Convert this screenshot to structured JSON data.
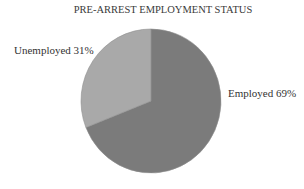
{
  "chart_data": {
    "type": "pie",
    "title": "PRE-ARREST EMPLOYMENT STATUS",
    "categories": [
      "Employed",
      "Unemployed"
    ],
    "values": [
      69,
      31
    ],
    "labels": [
      "Employed 69%",
      "Unemployed 31%"
    ],
    "colors": [
      "#7b7b7b",
      "#a9a9a9"
    ],
    "legend": "none (data labels beside slices)"
  }
}
